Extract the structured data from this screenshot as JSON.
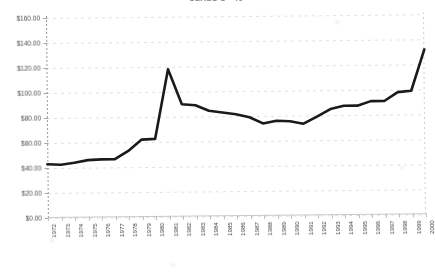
{
  "chart_data": {
    "type": "line",
    "title": "CLASS 1 - 40",
    "xlabel": "",
    "ylabel": "",
    "x": [
      1972,
      1973,
      1974,
      1975,
      1976,
      1977,
      1978,
      1979,
      1980,
      1981,
      1982,
      1983,
      1984,
      1985,
      1986,
      1987,
      1988,
      1989,
      1990,
      1991,
      1992,
      1993,
      1994,
      1995,
      1996,
      1997,
      1998,
      1999,
      2000
    ],
    "categories": [
      "1972",
      "1973",
      "1974",
      "1975",
      "1976",
      "1977",
      "1978",
      "1979",
      "1980",
      "1981",
      "1982",
      "1983",
      "1984",
      "1985",
      "1986",
      "1987",
      "1988",
      "1989",
      "1990",
      "1991",
      "1992",
      "1993",
      "1994",
      "1995",
      "1996",
      "1997",
      "1998",
      "1999",
      "2000"
    ],
    "values": [
      43.0,
      42.5,
      44.0,
      46.0,
      46.5,
      46.5,
      53.0,
      62.0,
      62.5,
      118.0,
      90.0,
      89.0,
      84.5,
      83.0,
      81.5,
      79.0,
      74.0,
      76.0,
      75.5,
      73.5,
      79.0,
      85.0,
      87.5,
      87.5,
      91.0,
      91.0,
      98.0,
      99.0,
      132.0
    ],
    "series": [
      {
        "name": "CLASS 1 - 40",
        "values": [
          43.0,
          42.5,
          44.0,
          46.0,
          46.5,
          46.5,
          53.0,
          62.0,
          62.5,
          118.0,
          90.0,
          89.0,
          84.5,
          83.0,
          81.5,
          79.0,
          74.0,
          76.0,
          75.5,
          73.5,
          79.0,
          85.0,
          87.5,
          87.5,
          91.0,
          91.0,
          98.0,
          99.0,
          132.0
        ]
      }
    ],
    "ylim": [
      0,
      160
    ],
    "ytick_values": [
      0,
      20,
      40,
      60,
      80,
      100,
      120,
      140,
      160
    ],
    "ytick_labels": [
      "$0.00",
      "$20.00",
      "$40.00",
      "$60.00",
      "$80.00",
      "$100.00",
      "$120.00",
      "$140.00",
      "$160.00"
    ],
    "grid": true,
    "legend": false,
    "line_color": "#1a1a1a",
    "grid_color": "#dcdcdc",
    "axis_color": "#a8a8a8",
    "background_color": "#ffffff"
  }
}
